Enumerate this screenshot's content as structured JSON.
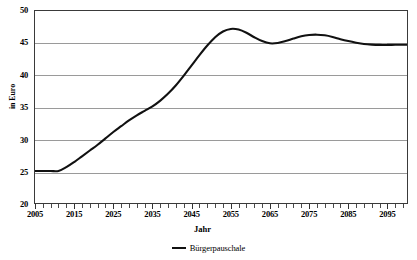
{
  "chart_data": {
    "type": "line",
    "title": "",
    "xlabel": "Jahr",
    "ylabel": "in Euro",
    "xlim": [
      2005,
      2100
    ],
    "ylim": [
      20,
      50
    ],
    "yticks": [
      20,
      25,
      30,
      35,
      40,
      45,
      50
    ],
    "xticks": [
      2005,
      2015,
      2025,
      2035,
      2045,
      2055,
      2065,
      2075,
      2085,
      2095
    ],
    "xtick_minor_step": 2,
    "grid": "horizontal",
    "legend_position": "bottom",
    "series": [
      {
        "name": "Bürgerpauschale",
        "color": "#111111",
        "x": [
          2005,
          2007,
          2009,
          2011,
          2013,
          2015,
          2017,
          2019,
          2021,
          2023,
          2025,
          2027,
          2029,
          2031,
          2033,
          2035,
          2037,
          2039,
          2041,
          2043,
          2045,
          2047,
          2049,
          2051,
          2053,
          2055,
          2057,
          2059,
          2061,
          2063,
          2065,
          2067,
          2069,
          2071,
          2073,
          2075,
          2077,
          2079,
          2081,
          2083,
          2085,
          2087,
          2089,
          2091,
          2093,
          2095,
          2097,
          2099,
          2100
        ],
        "y": [
          25.0,
          25.0,
          25.0,
          25.0,
          25.6,
          26.4,
          27.3,
          28.2,
          29.1,
          30.1,
          31.1,
          32.0,
          32.9,
          33.7,
          34.4,
          35.1,
          36.0,
          37.1,
          38.4,
          39.9,
          41.5,
          43.1,
          44.6,
          45.9,
          46.8,
          47.2,
          47.1,
          46.6,
          45.9,
          45.3,
          44.95,
          45.0,
          45.3,
          45.7,
          46.05,
          46.25,
          46.3,
          46.2,
          45.95,
          45.6,
          45.3,
          45.05,
          44.85,
          44.75,
          44.7,
          44.7,
          44.72,
          44.73,
          44.73
        ]
      }
    ]
  },
  "axes": {
    "y_tick_labels": [
      "50",
      "45",
      "40",
      "35",
      "30",
      "25",
      "20"
    ],
    "x_tick_labels": [
      "2005",
      "2015",
      "2025",
      "2035",
      "2045",
      "2055",
      "2065",
      "2075",
      "2085",
      "2095"
    ],
    "y_title": "in Euro",
    "x_title": "Jahr"
  },
  "legend": {
    "entries": [
      {
        "label": "Bürgerpauschale",
        "color": "#111111"
      }
    ]
  },
  "title_strip": ""
}
